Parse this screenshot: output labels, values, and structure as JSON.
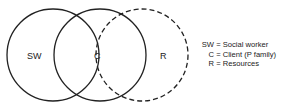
{
  "diagram": {
    "type": "venn",
    "circles": [
      {
        "id": "SW",
        "label": "SW",
        "cx": 53,
        "cy": 55,
        "r": 46,
        "style": "solid",
        "label_x": 34,
        "label_y": 58
      },
      {
        "id": "C",
        "label": "C",
        "cx": 100,
        "cy": 55,
        "r": 46,
        "style": "solid",
        "label_x": 97,
        "label_y": 58
      },
      {
        "id": "R",
        "label": "R",
        "cx": 142,
        "cy": 55,
        "r": 46,
        "style": "dashed",
        "label_x": 163,
        "label_y": 58
      }
    ],
    "stroke_color": "#222222"
  },
  "legend": [
    {
      "key": "SW",
      "eq": "=",
      "value": "Social worker"
    },
    {
      "key": "C",
      "eq": "=",
      "value": "Client (P family)"
    },
    {
      "key": "R",
      "eq": "=",
      "value": "Resources"
    }
  ]
}
